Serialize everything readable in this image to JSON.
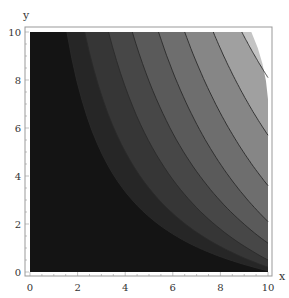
{
  "chart_data": {
    "type": "contour",
    "title": "",
    "xlabel": "x",
    "ylabel": "y",
    "xlim": [
      0,
      10
    ],
    "ylim": [
      0,
      10
    ],
    "xticks": [
      "0",
      "2",
      "4",
      "6",
      "8",
      "10"
    ],
    "yticks": [
      "0",
      "2",
      "4",
      "6",
      "8",
      "10"
    ],
    "grid": false,
    "legend": null,
    "colormap": "grayscale (dark at origin, light at top-right)",
    "band_colors": [
      "#141414",
      "#262626",
      "#363636",
      "#474747",
      "#5a5a5a",
      "#6e6e6e",
      "#868686",
      "#a0a0a0",
      "#c4c4c4"
    ],
    "contour_line_color": "#2a2a2a",
    "contours": [
      {
        "level": 1,
        "top_x": 1.55,
        "right_y": 0.05
      },
      {
        "level": 2,
        "top_x": 2.3,
        "right_y": 0.2
      },
      {
        "level": 3,
        "top_x": 3.3,
        "right_y": 0.5
      },
      {
        "level": 4,
        "top_x": 4.3,
        "right_y": 1.2
      },
      {
        "level": 5,
        "top_x": 5.4,
        "right_y": 2.1
      },
      {
        "level": 6,
        "top_x": 6.5,
        "right_y": 3.6
      },
      {
        "level": 7,
        "top_x": 7.7,
        "right_y": 5.7
      },
      {
        "level": 8,
        "top_x": 8.9,
        "right_y": 8.1
      }
    ]
  },
  "axes": {
    "x_label": "x",
    "y_label": "y"
  }
}
